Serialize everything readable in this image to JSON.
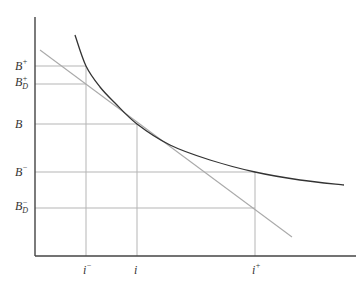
{
  "diagram": {
    "type": "bond price-yield convexity diagram",
    "axes": {
      "x_axis": {
        "from": [
          35,
          256
        ],
        "to": [
          356,
          256
        ]
      },
      "y_axis": {
        "from": [
          35,
          17
        ],
        "to": [
          35,
          256
        ]
      }
    },
    "curve": {
      "name": "price-yield curve",
      "points": [
        [
          75,
          35
        ],
        [
          86,
          66
        ],
        [
          100,
          87
        ],
        [
          115,
          103
        ],
        [
          137,
          124
        ],
        [
          170,
          145
        ],
        [
          210,
          160
        ],
        [
          255,
          172
        ],
        [
          300,
          180
        ],
        [
          344,
          185
        ]
      ]
    },
    "tangent": {
      "name": "duration tangent line",
      "from": [
        40,
        50
      ],
      "to": [
        292,
        237
      ]
    },
    "y_labels": [
      {
        "id": "b-plus",
        "base": "B",
        "sup": "+",
        "sub": "",
        "y": 66
      },
      {
        "id": "b-d-plus",
        "base": "B",
        "sup": "+",
        "sub": "D",
        "y": 84
      },
      {
        "id": "b",
        "base": "B",
        "sup": "",
        "sub": "",
        "y": 124
      },
      {
        "id": "b-minus",
        "base": "B",
        "sup": "−",
        "sub": "",
        "y": 172
      },
      {
        "id": "b-d-minus",
        "base": "B",
        "sup": "−",
        "sub": "D",
        "y": 208
      }
    ],
    "x_labels": [
      {
        "id": "i-minus",
        "base": "i",
        "sup": "−",
        "x": 86
      },
      {
        "id": "i",
        "base": "i",
        "sup": "",
        "x": 137
      },
      {
        "id": "i-plus",
        "base": "i",
        "sup": "+",
        "x": 255
      }
    ],
    "guide_lines": {
      "horizontal": [
        {
          "y": 66,
          "x_end": 86
        },
        {
          "y": 84,
          "x_end": 86
        },
        {
          "y": 124,
          "x_end": 137
        },
        {
          "y": 172,
          "x_end": 255
        },
        {
          "y": 208,
          "x_end": 255
        }
      ],
      "vertical": [
        {
          "x": 86,
          "y_start": 66
        },
        {
          "x": 137,
          "y_start": 124
        },
        {
          "x": 255,
          "y_start": 172
        }
      ]
    },
    "colors": {
      "axis": "#444444",
      "curve": "#333333",
      "tangent": "#aaaaaa",
      "guide": "#b5b5b5",
      "label": "#333333"
    }
  }
}
